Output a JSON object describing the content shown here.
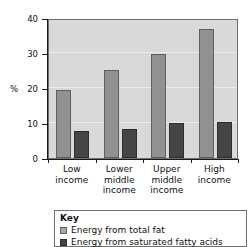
{
  "chart_data": {
    "type": "bar",
    "title": "",
    "xlabel": "",
    "ylabel": "%",
    "ylim": [
      0,
      40
    ],
    "yticks": [
      0,
      10,
      20,
      30,
      40
    ],
    "grid": true,
    "legend_position": "below",
    "categories": [
      "Low income",
      "Lower middle income",
      "Upper middle income",
      "High income"
    ],
    "category_lines": [
      [
        "Low",
        "income"
      ],
      [
        "Lower",
        "middle",
        "income"
      ],
      [
        "Upper",
        "middle",
        "income"
      ],
      [
        "High",
        "income"
      ]
    ],
    "series": [
      {
        "name": "Energy from total fat",
        "color": "#919191",
        "values": [
          19.5,
          25.2,
          29.7,
          36.8
        ]
      },
      {
        "name": "Energy from saturated fatty acids",
        "color": "#454545",
        "values": [
          7.8,
          8.2,
          10.0,
          10.4
        ]
      }
    ]
  },
  "axis": {
    "y_title": "%",
    "tick_labels": [
      "40",
      "30",
      "20",
      "10",
      "0"
    ]
  },
  "legend": {
    "title": "Key",
    "items": [
      {
        "label": "Energy from total fat",
        "swatch": "light"
      },
      {
        "label": "Energy from saturated fatty acids",
        "swatch": "dark"
      }
    ]
  },
  "colors": {
    "plot_background": "#d9d9d9",
    "total_fat": "#919191",
    "saturated_fat": "#454545",
    "axis": "#1a1a1a",
    "gridline": "#ececec"
  }
}
